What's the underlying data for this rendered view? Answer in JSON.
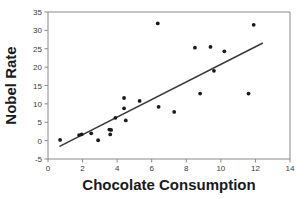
{
  "chart_data": {
    "type": "scatter",
    "title": "",
    "xlabel": "Chocolate Consumption",
    "ylabel": "Nobel Rate",
    "xlim": [
      0,
      14
    ],
    "ylim": [
      -5,
      35
    ],
    "xticks": [
      0,
      2,
      4,
      6,
      8,
      10,
      12,
      14
    ],
    "yticks": [
      -5,
      0,
      5,
      10,
      15,
      20,
      25,
      30,
      35
    ],
    "xtick_labels": [
      "0",
      "2",
      "4",
      "6",
      "8",
      "10",
      "12",
      "14"
    ],
    "ytick_labels": [
      "-5",
      "0",
      "5",
      "10",
      "15",
      "20",
      "25",
      "30",
      "35"
    ],
    "grid": false,
    "legend": "none",
    "marker_color": "#1a1a1a",
    "line_color": "#3a3a3a",
    "points": [
      {
        "x": 0.7,
        "y": 0.2
      },
      {
        "x": 1.8,
        "y": 1.5
      },
      {
        "x": 1.95,
        "y": 1.7
      },
      {
        "x": 2.5,
        "y": 2.0
      },
      {
        "x": 2.9,
        "y": 0.1
      },
      {
        "x": 3.55,
        "y": 3.0
      },
      {
        "x": 3.65,
        "y": 2.9
      },
      {
        "x": 3.6,
        "y": 1.7
      },
      {
        "x": 3.9,
        "y": 6.2
      },
      {
        "x": 4.4,
        "y": 11.6
      },
      {
        "x": 4.4,
        "y": 8.8
      },
      {
        "x": 4.5,
        "y": 5.5
      },
      {
        "x": 5.3,
        "y": 10.8
      },
      {
        "x": 6.35,
        "y": 31.9
      },
      {
        "x": 6.4,
        "y": 9.2
      },
      {
        "x": 7.3,
        "y": 7.8
      },
      {
        "x": 8.5,
        "y": 25.3
      },
      {
        "x": 8.8,
        "y": 12.8
      },
      {
        "x": 9.4,
        "y": 25.5
      },
      {
        "x": 9.6,
        "y": 19.0
      },
      {
        "x": 10.2,
        "y": 24.3
      },
      {
        "x": 11.6,
        "y": 12.8
      },
      {
        "x": 11.9,
        "y": 31.5
      }
    ],
    "trend_line": {
      "x0": 0.7,
      "y0": -1.5,
      "x1": 12.4,
      "y1": 26.5
    }
  }
}
